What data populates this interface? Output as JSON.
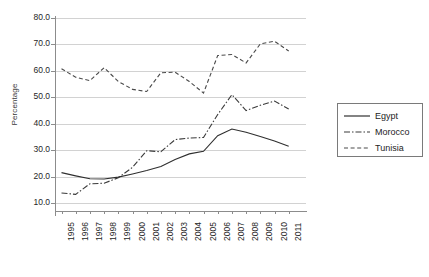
{
  "chart_data": {
    "type": "line",
    "title": "",
    "xlabel": "",
    "ylabel": "Percentage",
    "ylim": [
      0,
      80
    ],
    "yticks": [
      "10.0",
      "20.0",
      "30.0",
      "40.0",
      "50.0",
      "60.0",
      "70.0",
      "80.0"
    ],
    "ytick_values": [
      10,
      20,
      30,
      40,
      50,
      60,
      70,
      80
    ],
    "grid": true,
    "legend_position": "right",
    "categories": [
      "1995",
      "1996",
      "1997",
      "1998",
      "1999",
      "2000",
      "2001",
      "2002",
      "2003",
      "2004",
      "2005",
      "2006",
      "2007",
      "2008",
      "2009",
      "2010",
      "2011"
    ],
    "x": [
      1995,
      1996,
      1997,
      1998,
      1999,
      2000,
      2001,
      2002,
      2003,
      2004,
      2005,
      2006,
      2007,
      2008,
      2009,
      2010,
      2011
    ],
    "series": [
      {
        "name": "Egypt",
        "style": "solid",
        "color": "#2f2f2f",
        "values": [
          21.5,
          20.3,
          19.2,
          19.1,
          19.8,
          21.0,
          22.3,
          23.8,
          26.5,
          28.6,
          29.6,
          35.5,
          38.0,
          36.8,
          35.2,
          33.5,
          31.5
        ]
      },
      {
        "name": "Morocco",
        "style": "dash-dot",
        "color": "#3a3a3a",
        "values": [
          13.8,
          13.3,
          17.3,
          17.5,
          19.6,
          23.5,
          29.8,
          29.4,
          34.0,
          34.6,
          34.8,
          43.5,
          51.0,
          45.0,
          47.0,
          48.6,
          45.6
        ]
      },
      {
        "name": "Tunisia",
        "style": "dashed",
        "color": "#4a4a4a",
        "values": [
          60.8,
          57.6,
          56.3,
          61.2,
          56.0,
          53.0,
          52.2,
          59.3,
          59.5,
          56.0,
          51.6,
          65.8,
          66.2,
          63.0,
          70.2,
          71.2,
          67.5
        ]
      }
    ]
  },
  "legend": {
    "items": [
      {
        "label": "Egypt"
      },
      {
        "label": "Morocco"
      },
      {
        "label": "Tunisia"
      }
    ]
  }
}
